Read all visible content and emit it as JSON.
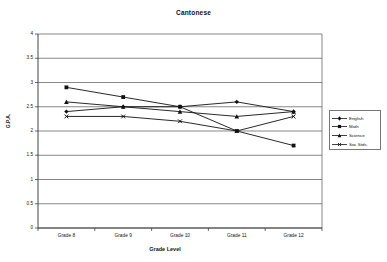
{
  "chart_data": {
    "type": "line",
    "title": "Cantonese",
    "xlabel": "Grade Level",
    "ylabel": "G.P.A.",
    "categories": [
      "Grade 8",
      "Grade 9",
      "Grade 10",
      "Grade 11",
      "Grade 12"
    ],
    "ylim": [
      0,
      4
    ],
    "ytick_labels": [
      "0",
      "0.5",
      "1",
      "1.5",
      "2",
      "2.5",
      "3",
      "3.5",
      "4"
    ],
    "ytick_values": [
      0,
      0.5,
      1,
      1.5,
      2,
      2.5,
      3,
      3.5,
      4
    ],
    "grid": "horizontal",
    "legend_position": "right",
    "series": [
      {
        "name": "English",
        "values": [
          2.4,
          2.5,
          2.5,
          2.6,
          2.4
        ],
        "marker": "diamond"
      },
      {
        "name": "Math",
        "values": [
          2.9,
          2.7,
          2.5,
          2.0,
          1.7
        ],
        "marker": "square"
      },
      {
        "name": "Science",
        "values": [
          2.6,
          2.5,
          2.4,
          2.3,
          2.4
        ],
        "marker": "triangle"
      },
      {
        "name": "Soc Stds",
        "values": [
          2.3,
          2.3,
          2.2,
          2.0,
          2.3
        ],
        "marker": "cross"
      }
    ]
  },
  "legend": {
    "items": [
      {
        "label": "English"
      },
      {
        "label": "Math"
      },
      {
        "label": "Science"
      },
      {
        "label": "Soc Stds"
      }
    ]
  }
}
